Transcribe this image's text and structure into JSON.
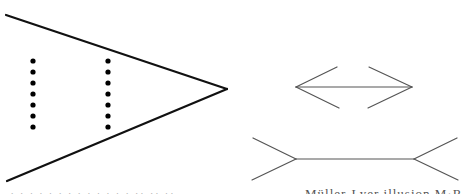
{
  "figure": {
    "colors": {
      "background": "#ffffff",
      "left_stroke": "#111111",
      "right_stroke": "#555555",
      "dot": "#000000"
    },
    "left_panel": {
      "apex": [
        227,
        89
      ],
      "top_line_start": [
        6,
        15
      ],
      "bottom_line_start": [
        7,
        181
      ],
      "dot_columns": [
        {
          "x": 33,
          "y": [
            61,
            72,
            83,
            94,
            105,
            116,
            127
          ]
        },
        {
          "x": 108,
          "y": [
            61,
            72,
            83,
            94,
            105,
            116,
            127
          ]
        }
      ]
    },
    "right_panel": {
      "arrow_inward": {
        "shaft": [
          [
            296,
            87
          ],
          [
            412,
            87
          ]
        ],
        "left_fins": [
          [
            337,
            67
          ],
          [
            339,
            108
          ]
        ],
        "right_fins": [
          [
            369,
            67
          ],
          [
            368,
            108
          ]
        ]
      },
      "arrow_outward": {
        "shaft": [
          [
            296,
            159
          ],
          [
            414,
            159
          ]
        ],
        "left_fins": [
          [
            253,
            138
          ],
          [
            252,
            180
          ]
        ],
        "right_fins": [
          [
            457,
            138
          ],
          [
            458,
            180
          ]
        ]
      }
    }
  },
  "captions": {
    "left": "· · · · · · · · ·  · · · ·  ·· ·· ··",
    "right": "Müller-Lyer illusion  M·R·Ho"
  }
}
